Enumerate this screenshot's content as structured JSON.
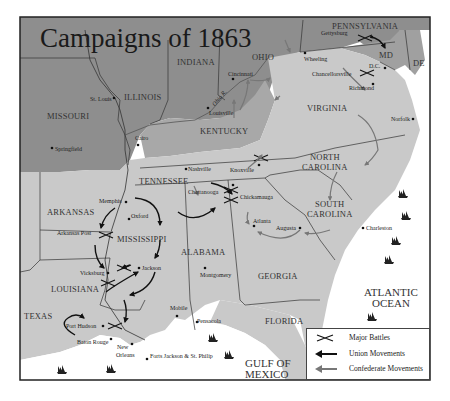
{
  "title": "Campaigns of 1863",
  "colors": {
    "union_states": "#8e8e8e",
    "confederate_states": "#c9c9c9",
    "border_states": "#a8a8a8",
    "water": "#ffffff",
    "union_arrow": "#111111",
    "confederate_arrow": "#777777",
    "frame": "#222222"
  },
  "states": {
    "missouri": "MISSOURI",
    "illinois": "ILLINOIS",
    "indiana": "INDIANA",
    "ohio": "OHIO",
    "pennsylvania": "PENNSYLVANIA",
    "maryland": "MD",
    "delaware": "DE",
    "kentucky": "KENTUCKY",
    "virginia": "VIRGINIA",
    "tennessee": "TENNESSEE",
    "north_carolina_1": "NORTH",
    "north_carolina_2": "CAROLINA",
    "south_carolina_1": "SOUTH",
    "south_carolina_2": "CAROLINA",
    "arkansas": "ARKANSAS",
    "mississippi": "MISSISSIPPI",
    "alabama": "ALABAMA",
    "georgia": "GEORGIA",
    "louisiana": "LOUISIANA",
    "texas": "TEXAS",
    "florida": "FLORIDA"
  },
  "water": {
    "atlantic_1": "ATLANTIC",
    "atlantic_2": "OCEAN",
    "gulf_1": "GULF OF",
    "gulf_2": "MEXICO",
    "ohio_river": "Ohio R."
  },
  "cities": {
    "st_louis": "St. Louis",
    "springfield": "Springfield",
    "cairo": "Cairo",
    "cincinnati": "Cincinnati",
    "louisville": "Louisville",
    "wheeling": "Wheeling",
    "gettysburg": "Gettysburg",
    "dc": "D.C.",
    "chancellorsville": "Chancellorsville",
    "richmond": "Richmond",
    "norfolk": "Norfolk",
    "nashville": "Nashville",
    "knoxville": "Knoxville",
    "chattanooga": "Chattanooga",
    "chickamauga": "Chickamauga",
    "atlanta": "Atlanta",
    "augusta": "Augusta",
    "charleston": "Charleston",
    "memphis": "Memphis",
    "oxford": "Oxford",
    "arkansas_post": "Arkansas Post",
    "vicksburg": "Vicksburg",
    "jackson": "Jackson",
    "montgomery": "Montgomery",
    "mobile": "Mobile",
    "pensacola": "Pensacola",
    "jacksonville": "Jacksonville",
    "port_hudson": "Port Hudson",
    "baton_rouge": "Baton Rouge",
    "new_orleans_1": "New",
    "new_orleans_2": "Orleans",
    "forts": "Forts Jackson & St. Philip"
  },
  "legend": {
    "items": [
      {
        "icon": "crossed-swords-icon",
        "label": "Major Battles"
      },
      {
        "icon": "union-arrow-icon",
        "label": "Union Movements"
      },
      {
        "icon": "confederate-arrow-icon",
        "label": "Confederate Movements"
      }
    ]
  }
}
